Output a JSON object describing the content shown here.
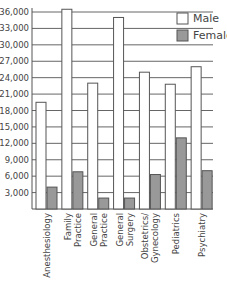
{
  "chart_data": {
    "type": "bar",
    "title": "",
    "xlabel": "",
    "ylabel": "",
    "ylim": [
      0,
      36000
    ],
    "yticks": [
      "3,000",
      "6,000",
      "9,000",
      "12,000",
      "15,000",
      "18,000",
      "21,000",
      "24,000",
      "27,000",
      "30,000",
      "33,000",
      "36,000"
    ],
    "categories": [
      "Anesthesiology",
      "Family Practice",
      "General Practice",
      "General Surgery",
      "Obstetrics/ Gynecology",
      "Pediatrics",
      "Psychiatry"
    ],
    "category_lines": [
      [
        "Anesthesiology"
      ],
      [
        "Family",
        "Practice"
      ],
      [
        "General",
        "Practice"
      ],
      [
        "General",
        "Surgery"
      ],
      [
        "Obstetrics/",
        "Gynecology"
      ],
      [
        "Pediatrics"
      ],
      [
        "Psychiatry"
      ]
    ],
    "series": [
      {
        "name": "Male",
        "color": "#ffffff",
        "values": [
          19500,
          36500,
          23000,
          35000,
          25000,
          22800,
          26000
        ]
      },
      {
        "name": "Female",
        "color": "#999999",
        "values": [
          4000,
          6800,
          2000,
          2000,
          6300,
          13000,
          7000
        ]
      }
    ],
    "grid": true,
    "legend_position": "top-right"
  },
  "legend": {
    "male": "Male",
    "female": "Female"
  }
}
